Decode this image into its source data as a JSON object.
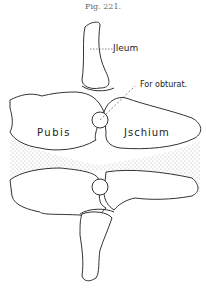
{
  "figure": {
    "title": "Fig. 221.",
    "labels": {
      "ileum": "Jleum",
      "foramen": "For obturat.",
      "pubis": "Pubis",
      "ischium": "Jschium"
    },
    "colors": {
      "line": "#333333",
      "stipple": "#9a9a9a",
      "background": "#ffffff"
    }
  }
}
